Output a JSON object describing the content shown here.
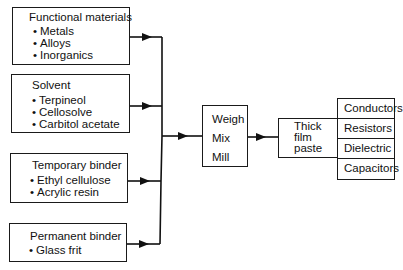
{
  "inputs": [
    {
      "title": "Functional materials",
      "items": [
        "Metals",
        "Alloys",
        "Inorganics"
      ]
    },
    {
      "title": "Solvent",
      "items": [
        "Terpineol",
        "Cellosolve",
        "Carbitol acetate"
      ]
    },
    {
      "title": "Temporary binder",
      "items": [
        "Ethyl cellulose",
        "Acrylic resin"
      ]
    },
    {
      "title": "Permanent binder",
      "items": [
        "Glass frit"
      ]
    }
  ],
  "process": {
    "steps": [
      "Weigh",
      "Mix",
      "Mill"
    ]
  },
  "product": {
    "lines": [
      "Thick",
      "film",
      "paste"
    ]
  },
  "outputs": [
    "Conductors",
    "Resistors",
    "Dielectric",
    "Capacitors"
  ]
}
